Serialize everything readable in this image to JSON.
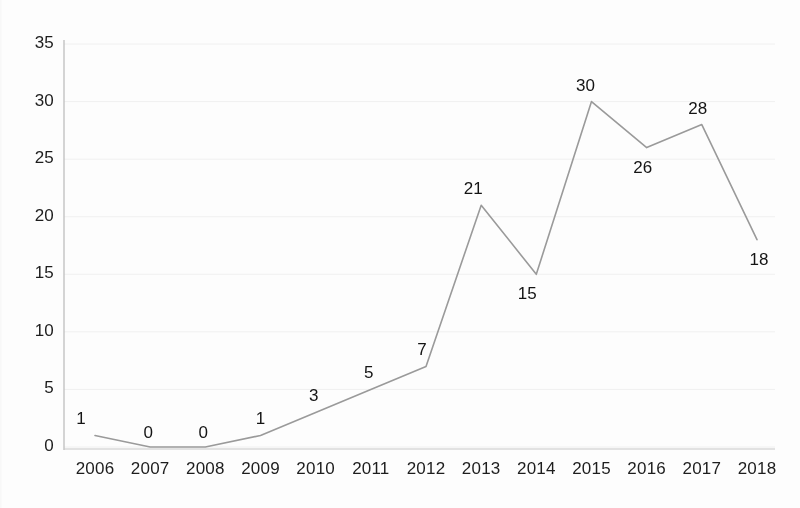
{
  "chart_data": {
    "type": "line",
    "title": "",
    "subtitle": "",
    "xlabel": "",
    "ylabel": "",
    "categories": [
      "2006",
      "2007",
      "2008",
      "2009",
      "2010",
      "2011",
      "2012",
      "2013",
      "2014",
      "2015",
      "2016",
      "2017",
      "2018"
    ],
    "values": [
      1,
      0,
      0,
      1,
      3,
      5,
      7,
      21,
      15,
      30,
      26,
      28,
      18
    ],
    "data_labels": [
      "1",
      "0",
      "0",
      "1",
      "3",
      "5",
      "7",
      "21",
      "15",
      "30",
      "26",
      "28",
      "18"
    ],
    "ylim": [
      0,
      35
    ],
    "y_ticks": [
      "0",
      "5",
      "10",
      "15",
      "20",
      "25",
      "30",
      "35"
    ],
    "y_tick_values": [
      0,
      5,
      10,
      15,
      20,
      25,
      30,
      35
    ],
    "xlim_categories": [
      "2006",
      "2018"
    ],
    "grid": "horizontal-faint",
    "legend": "none",
    "legend_position": "none",
    "markers": "none",
    "series": [
      {
        "name": "",
        "values": [
          1,
          0,
          0,
          1,
          3,
          5,
          7,
          21,
          15,
          30,
          26,
          28,
          18
        ]
      }
    ],
    "colors": {
      "line": "#9a9a9a",
      "axis": "#b9b9b9",
      "grid": "#f0f0f0",
      "text": "#1d1d1d",
      "background": "#fdfdfd"
    }
  },
  "axes": {
    "y_labels": [
      {
        "text": "35",
        "value": 35
      },
      {
        "text": "30",
        "value": 30
      },
      {
        "text": "25",
        "value": 25
      },
      {
        "text": "20",
        "value": 20
      },
      {
        "text": "15",
        "value": 15
      },
      {
        "text": "10",
        "value": 10
      },
      {
        "text": "5",
        "value": 5
      },
      {
        "text": "0",
        "value": 0
      }
    ],
    "x_labels": [
      {
        "text": "2006"
      },
      {
        "text": "2007"
      },
      {
        "text": "2008"
      },
      {
        "text": "2009"
      },
      {
        "text": "2010"
      },
      {
        "text": "2011"
      },
      {
        "text": "2012"
      },
      {
        "text": "2013"
      },
      {
        "text": "2014"
      },
      {
        "text": "2015"
      },
      {
        "text": "2016"
      },
      {
        "text": "2017"
      },
      {
        "text": "2018"
      }
    ]
  },
  "point_labels": [
    {
      "text": "1"
    },
    {
      "text": "0"
    },
    {
      "text": "0"
    },
    {
      "text": "1"
    },
    {
      "text": "3"
    },
    {
      "text": "5"
    },
    {
      "text": "7"
    },
    {
      "text": "21"
    },
    {
      "text": "15"
    },
    {
      "text": "30"
    },
    {
      "text": "26"
    },
    {
      "text": "28"
    },
    {
      "text": "18"
    }
  ]
}
